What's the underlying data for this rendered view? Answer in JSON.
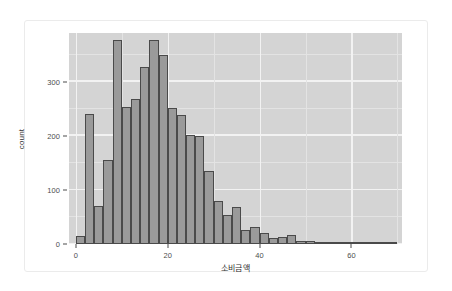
{
  "chart_data": {
    "type": "bar",
    "title": "",
    "subtitle": "",
    "xlabel": "소비금액",
    "ylabel": "count",
    "xlim": [
      -1.5,
      71
    ],
    "ylim": [
      0,
      390
    ],
    "grid": true,
    "legend": null,
    "bin_width": 2,
    "x_ticks": [
      "0",
      "20",
      "40",
      "60"
    ],
    "x_tick_values": [
      0,
      20,
      40,
      60
    ],
    "y_ticks": [
      "0",
      "100",
      "200",
      "300"
    ],
    "y_tick_values": [
      0,
      100,
      200,
      300
    ],
    "x_minor_tick_values": [
      10,
      30,
      50,
      70
    ],
    "y_minor_tick_values": [
      50,
      150,
      250,
      350
    ],
    "bin_centers": [
      1,
      3,
      5,
      7,
      9,
      11,
      13,
      15,
      17,
      19,
      21,
      23,
      25,
      27,
      29,
      31,
      33,
      35,
      37,
      39,
      41,
      43,
      45,
      47,
      49,
      51,
      53,
      55,
      57,
      59,
      61,
      63,
      65,
      67,
      69
    ],
    "bin_starts": [
      0,
      2,
      4,
      6,
      8,
      10,
      12,
      14,
      16,
      18,
      20,
      22,
      24,
      26,
      28,
      30,
      32,
      34,
      36,
      38,
      40,
      42,
      44,
      46,
      48,
      50,
      52,
      54,
      56,
      58,
      60,
      62,
      64,
      66,
      68
    ],
    "values": [
      15,
      240,
      70,
      155,
      378,
      253,
      268,
      327,
      378,
      350,
      252,
      238,
      201,
      199,
      135,
      80,
      54,
      68,
      25,
      31,
      21,
      11,
      13,
      16,
      6,
      5,
      4,
      4,
      1,
      1,
      0,
      0,
      1,
      0,
      1
    ],
    "colors": {
      "bar_fill": "#9a9a9a",
      "bar_stroke": "#4a4a4a",
      "panel_background": "#d4d4d4",
      "gridline_major": "#f2f2f2",
      "gridline_minor": "#e3e3e3",
      "axis_text": "#4d4d4d",
      "axis_title": "#303030",
      "card_background": "#ffffff",
      "card_border": "#ebebeb",
      "page_background": "#ffffff"
    }
  }
}
